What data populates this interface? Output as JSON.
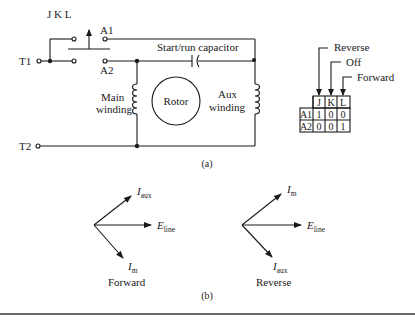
{
  "figure": {
    "part_a": {
      "caption": "(a)",
      "terminals": {
        "t1": "T1",
        "t2": "T2"
      },
      "switch": {
        "label": "J K L",
        "contact_upper": "A1",
        "contact_lower": "A2"
      },
      "capacitor_label": "Start/run capacitor",
      "main_winding": {
        "line1": "Main",
        "line2": "winding"
      },
      "rotor_label": "Rotor",
      "aux_winding": {
        "line1": "Aux",
        "line2": "winding"
      },
      "switch_table": {
        "positions": {
          "reverse": "Reverse",
          "off": "Off",
          "forward": "Forward"
        },
        "columns": [
          "J",
          "K",
          "L"
        ],
        "rows": [
          {
            "label": "A1",
            "values": [
              "1",
              "0",
              "0"
            ]
          },
          {
            "label": "A2",
            "values": [
              "0",
              "0",
              "1"
            ]
          }
        ]
      }
    },
    "part_b": {
      "caption": "(b)",
      "forward": {
        "title": "Forward",
        "upper_vector": {
          "main": "I",
          "sub": "aux"
        },
        "middle_vector": {
          "main": "E",
          "sub": "line"
        },
        "lower_vector": {
          "main": "I",
          "sub": "m"
        }
      },
      "reverse": {
        "title": "Reverse",
        "upper_vector": {
          "main": "I",
          "sub": "m"
        },
        "middle_vector": {
          "main": "E",
          "sub": "line"
        },
        "lower_vector": {
          "main": "I",
          "sub": "aux"
        }
      }
    }
  }
}
